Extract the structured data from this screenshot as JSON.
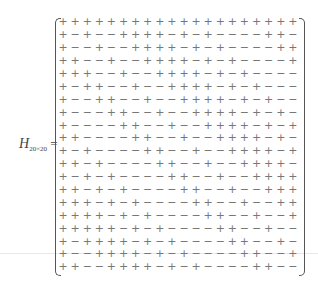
{
  "label": {
    "symbol": "H",
    "subscript": "20×20",
    "equals": "="
  },
  "matrix": {
    "rows": [
      "+ + + + + + + + + + + + + + + + + + + +",
      "+ − + − − + + + + − + − + − − − − + + −",
      "+ − − + − − + + + + − + − + − − − − + +",
      "+ + − − + − − + + + + − + − + − − − − +",
      "+ + + − − + − − + + + + − + − + − − − −",
      "+ − + + − − + − − + + + + − + − + − − −",
      "+ − − + + − − + − − + + + + − + − + − −",
      "+ − − − + + − − + − − + + + + − + − + −",
      "+ − − − − + + − − + − − + + + + − + − +",
      "+ + − − − − + + − − + − − + + + + − + −",
      "+ − + − − − − + + − − + − − + + + + − +",
      "+ + − + − − − − + + − − + − − + + + + −",
      "+ − + − + − − − − + + − − + − − + + + +",
      "+ + − + − + − − − − + + − − + − − + + +",
      "+ + + − + − + − − − − + + − − + − − + +",
      "+ + + + − + − + − − − − + + − − + − − +",
      "+ + + + + − + − + − − − − + + − − + − −",
      "+ − + + + + − + − + − − − − + + − − + −",
      "+ − − + + + + − + − + − − − − + + − − +",
      "+ + − − + + + + − + − + − − − − + + − −"
    ]
  }
}
